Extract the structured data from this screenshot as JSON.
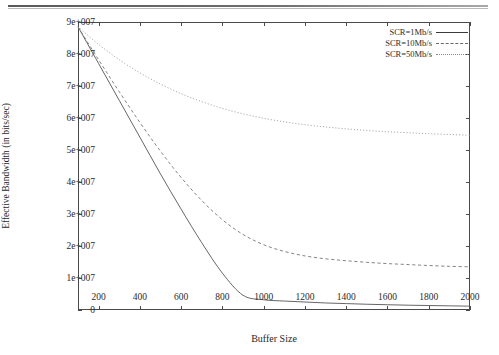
{
  "chart_data": {
    "type": "line",
    "title": "",
    "xlabel": "Buffer Size",
    "ylabel": "Effective Bandwidth (in bits/sec)",
    "xlim": [
      100,
      2000
    ],
    "ylim": [
      0,
      90000000
    ],
    "grid": false,
    "legend_position": "top-right",
    "xticks": [
      200,
      400,
      600,
      800,
      1000,
      1200,
      1400,
      1600,
      1800,
      2000
    ],
    "xticklabels": [
      "200",
      "400",
      "600",
      "800",
      "1000",
      "1200",
      "1400",
      "1600",
      "1800",
      "2000"
    ],
    "yticks": [
      0,
      10000000,
      20000000,
      30000000,
      40000000,
      50000000,
      60000000,
      70000000,
      80000000,
      90000000
    ],
    "yticklabels": [
      "0",
      "1e+007",
      "2e+007",
      "3e+007",
      "4e+007",
      "5e+007",
      "6e+007",
      "7e+007",
      "8e+007",
      "9e+007"
    ],
    "x": [
      100,
      200,
      300,
      400,
      500,
      600,
      700,
      800,
      900,
      1000,
      1100,
      1200,
      1300,
      1400,
      1500,
      1600,
      1700,
      1800,
      1900,
      2000
    ],
    "series": [
      {
        "name": "SCR=1Mb/s",
        "style": "solid",
        "color": "#555555",
        "values": [
          88500000,
          77000000,
          65500000,
          54000000,
          42500000,
          31500000,
          21000000,
          11500000,
          4600000,
          3200000,
          2800000,
          2500000,
          2200000,
          2000000,
          1800000,
          1650000,
          1500000,
          1400000,
          1300000,
          1200000
        ]
      },
      {
        "name": "SCR=10Mb/s",
        "style": "dashed",
        "color": "#777777",
        "values": [
          88500000,
          78200000,
          68200000,
          58600000,
          49600000,
          41400000,
          34200000,
          28200000,
          23600000,
          20400000,
          18300000,
          16900000,
          16000000,
          15400000,
          14900000,
          14500000,
          14200000,
          13900000,
          13650000,
          13500000
        ]
      },
      {
        "name": "SCR=50Mb/s",
        "style": "dotted",
        "color": "#9a9a9a",
        "values": [
          88500000,
          83000000,
          78200000,
          74100000,
          70600000,
          67600000,
          65100000,
          63000000,
          61300000,
          59900000,
          58800000,
          57900000,
          57200000,
          56600000,
          56100000,
          55700000,
          55400000,
          55100000,
          54850000,
          54600000
        ]
      }
    ]
  },
  "legend": {
    "entries": [
      {
        "label": "SCR=1Mb/s",
        "style": "solid"
      },
      {
        "label": "SCR=10Mb/s",
        "style": "dashed"
      },
      {
        "label": "SCR=50Mb/s",
        "style": "dotted"
      }
    ]
  }
}
